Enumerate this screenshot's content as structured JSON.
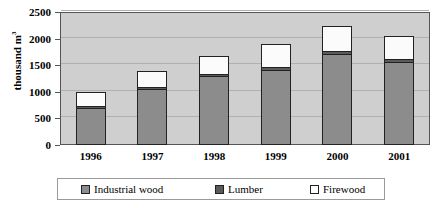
{
  "chart_data": {
    "type": "bar",
    "subtype": "stacked-column",
    "title": "",
    "xlabel": "",
    "ylabel": "thousand m",
    "ylabel_superscript": "3",
    "categories": [
      "1996",
      "1997",
      "1998",
      "1999",
      "2000",
      "2001"
    ],
    "ylim": [
      0,
      2500
    ],
    "yticks": [
      0,
      500,
      1000,
      1500,
      2000,
      2500
    ],
    "ytick_labels": [
      "0",
      "500",
      "1000",
      "1500",
      "2000",
      "2500"
    ],
    "grid": true,
    "legend_position": "bottom",
    "series": [
      {
        "name": "Industrial wood",
        "color": "#8c8c8c",
        "values": [
          680,
          1040,
          1280,
          1400,
          1690,
          1540
        ]
      },
      {
        "name": "Lumber",
        "color": "#5a5a5a",
        "values": [
          50,
          55,
          60,
          60,
          80,
          75
        ]
      },
      {
        "name": "Firewood",
        "color": "#ffffff",
        "values": [
          270,
          305,
          330,
          440,
          460,
          440
        ]
      }
    ],
    "totals": [
      1000,
      1400,
      1670,
      1900,
      2230,
      2055
    ]
  },
  "legend": {
    "items": [
      {
        "label": "Industrial wood",
        "swatch": "industrial-wood-swatch"
      },
      {
        "label": "Lumber",
        "swatch": "lumber-swatch"
      },
      {
        "label": "Firewood",
        "swatch": "firewood-swatch"
      }
    ]
  }
}
